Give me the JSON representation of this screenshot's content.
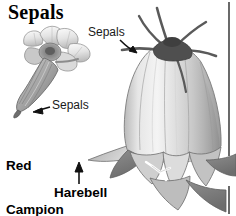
{
  "figure": {
    "title": "Sepals",
    "background_color": "#ffffff",
    "ink_color": "#111111",
    "width": 236,
    "height": 216
  },
  "labels": {
    "title": "Sepals",
    "sepals_harebell": "Sepals",
    "sepals_campion": "Sepals",
    "red_campion": "Red\nCampion",
    "red_campion_line1": "Red",
    "red_campion_line2": "Campion",
    "harebell": "Harebell"
  },
  "specimens": [
    {
      "name": "Red Campion",
      "position": "left",
      "parts_labeled": [
        "Sepals"
      ],
      "description": "Small pink-campion flower viewed from the side with five notched petals at top and a tapering tubular calyx of fused sepals angled down to the lower left"
    },
    {
      "name": "Harebell",
      "position": "right",
      "parts_labeled": [
        "Sepals"
      ],
      "description": "Large pendent bell-shaped flower with five flared petal lobes and five narrow pointed sepals radiating from the top, white stigma protruding at the mouth"
    }
  ],
  "annotations": [
    {
      "label": "Sepals",
      "target": "harebell-sepals",
      "arrow_direction": "down-right"
    },
    {
      "label": "Sepals",
      "target": "red-campion-calyx",
      "arrow_direction": "left"
    },
    {
      "label": "Harebell",
      "target": "harebell-petal-lobe",
      "arrow_direction": "up"
    }
  ],
  "rule": {
    "name": "right-margin-rule",
    "orientation": "vertical",
    "color": "#1a1a1a"
  }
}
